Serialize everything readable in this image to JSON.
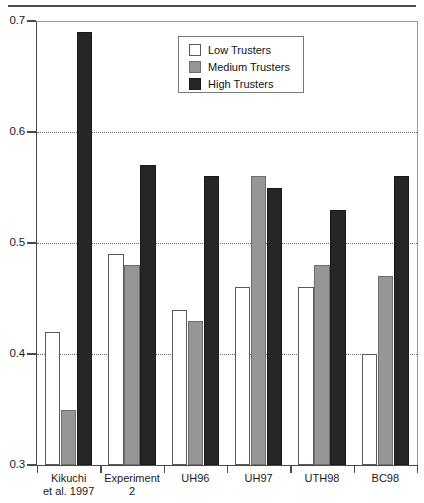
{
  "chart_data": {
    "type": "bar",
    "title": "",
    "xlabel": "",
    "ylabel": "",
    "ylim": [
      0.3,
      0.7
    ],
    "yticks": [
      "0.3",
      "0.4",
      "0.5",
      "0.6",
      "0.7"
    ],
    "grid": "horizontal-dotted",
    "legend_position": "top-center",
    "categories": [
      {
        "line1": "Kikuchi",
        "line2": "et al. 1997"
      },
      {
        "line1": "Experiment",
        "line2": "2"
      },
      {
        "line1": "UH96",
        "line2": ""
      },
      {
        "line1": "UH97",
        "line2": ""
      },
      {
        "line1": "UTH98",
        "line2": ""
      },
      {
        "line1": "BC98",
        "line2": ""
      }
    ],
    "series": [
      {
        "name": "Low Trusters",
        "key": "low",
        "color": "#ffffff",
        "values": [
          0.42,
          0.49,
          0.44,
          0.46,
          0.46,
          0.4
        ]
      },
      {
        "name": "Medium Trusters",
        "key": "medium",
        "color": "#969696",
        "values": [
          0.35,
          0.48,
          0.43,
          0.56,
          0.48,
          0.47
        ]
      },
      {
        "name": "High Trusters",
        "key": "high",
        "color": "#262626",
        "values": [
          0.69,
          0.57,
          0.56,
          0.55,
          0.53,
          0.56
        ]
      }
    ]
  },
  "legend": {
    "entries": [
      {
        "label": "Low Trusters",
        "swatch": "low"
      },
      {
        "label": "Medium Trusters",
        "swatch": "medium"
      },
      {
        "label": "High Trusters",
        "swatch": "high"
      }
    ]
  }
}
